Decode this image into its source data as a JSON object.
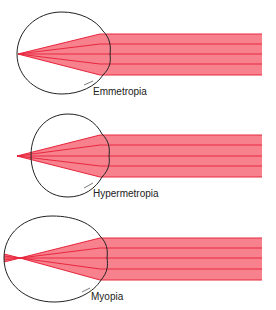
{
  "diagram": {
    "colors": {
      "beam_fill": "#f7828e",
      "beam_line": "#e8283f",
      "eye_outline": "#222222",
      "label": "#222222"
    },
    "panels": [
      {
        "name": "emmetropia",
        "label": "Emmetropia",
        "focus": "on retina"
      },
      {
        "name": "hypermetropia",
        "label": "Hypermetropia",
        "focus": "behind retina"
      },
      {
        "name": "myopia",
        "label": "Myopia",
        "focus": "in front of retina"
      }
    ]
  }
}
